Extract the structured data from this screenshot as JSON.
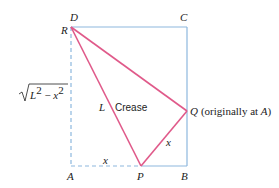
{
  "figure": {
    "points": {
      "D": "D",
      "C": "C",
      "R": "R",
      "A": "A",
      "P": "P",
      "B": "B",
      "Q": "Q"
    },
    "q_note": "(originally at ",
    "q_note_point": "A",
    "q_note_close": ")",
    "crease_label": "Crease",
    "L_label": "L",
    "x_bottom_label": "x",
    "x_right_label": "x",
    "sqrt_label": {
      "L": "L",
      "exp1": "2",
      "minus": " − ",
      "x": "x",
      "exp2": "2"
    },
    "colors": {
      "rectangle": "#8db8de",
      "crease": "#e05a8a",
      "text": "#222222"
    }
  }
}
